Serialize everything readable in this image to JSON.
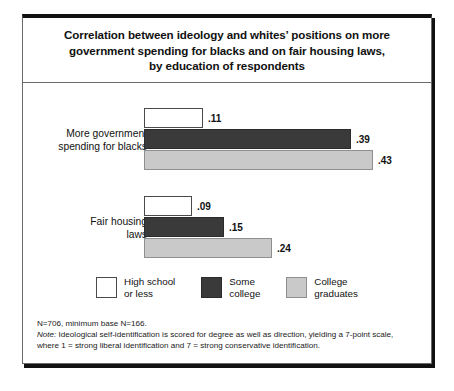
{
  "figure": {
    "title_lines": [
      "Correlation between ideology and whites’ positions on more",
      "government spending for blacks and on fair housing laws,",
      "by education of respondents"
    ],
    "footnote": {
      "base_line": "N=706, minimum base N=166.",
      "note_label": "Note:",
      "note_text_line1": " Ideological self-identification is scored for degree as well as direction, yielding a 7-point scale,",
      "note_text_line2": "where 1 = strong liberal identification and 7 = strong conservative identification."
    }
  },
  "chart_data": {
    "type": "bar",
    "orientation": "horizontal",
    "title": "Correlation between ideology and whites’ positions on more government spending for blacks and on fair housing laws, by education of respondents",
    "categories": [
      "More government\nspending for blacks",
      "Fair housing\nlaws"
    ],
    "series": [
      {
        "name": "High school\nor less",
        "color": "#ffffff",
        "values": [
          0.11,
          0.09
        ],
        "labels": [
          ".11",
          ".09"
        ]
      },
      {
        "name": "Some\ncollege",
        "color": "#3a3a3a",
        "values": [
          0.39,
          0.15
        ],
        "labels": [
          ".39",
          ".15"
        ]
      },
      {
        "name": "College\ngraduates",
        "color": "#c9c9c9",
        "values": [
          0.43,
          0.24
        ],
        "labels": [
          ".43",
          ".24"
        ]
      }
    ],
    "xlabel": "",
    "ylabel": "",
    "xlim": [
      0,
      0.5
    ],
    "grid": false,
    "legend_position": "bottom"
  }
}
